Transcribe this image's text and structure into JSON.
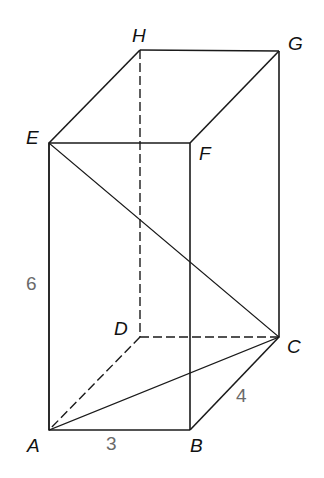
{
  "figure": {
    "type": "rectangular prism (cuboid) with shaded cross-section triangle",
    "vertices": {
      "A": "A",
      "B": "B",
      "C": "C",
      "D": "D",
      "E": "E",
      "F": "F",
      "G": "G",
      "H": "H"
    },
    "dimensions": {
      "AB": "3",
      "BC": "4",
      "AE": "6"
    },
    "shaded_region": "triangle EAC",
    "hidden_edges": [
      "HD",
      "DC",
      "DA"
    ],
    "colors": {
      "line": "#1a1a1a",
      "vertex_label": "#111111",
      "dimension_label": "#6a6a6a",
      "background": "#ffffff"
    }
  }
}
